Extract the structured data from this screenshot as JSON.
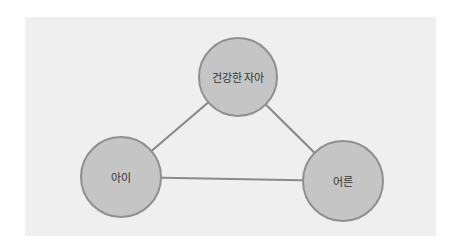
{
  "diagram": {
    "type": "triangle-relationship",
    "colors": {
      "background": "#ffffff",
      "panel": "#efefef",
      "node_fill": "#c5c5c5",
      "node_stroke": "#8f8f8f",
      "edge": "#8a8a8a",
      "text": "#333333"
    },
    "nodes": [
      {
        "id": "healthy-self",
        "label": "건강한 자아",
        "cx": 238,
        "cy": 77,
        "r": 39
      },
      {
        "id": "child",
        "label": "아이",
        "cx": 121,
        "cy": 177,
        "r": 40
      },
      {
        "id": "adult",
        "label": "어른",
        "cx": 343,
        "cy": 181,
        "r": 40
      }
    ],
    "edges": [
      {
        "from": "healthy-self",
        "to": "child"
      },
      {
        "from": "healthy-self",
        "to": "adult"
      },
      {
        "from": "child",
        "to": "adult"
      }
    ]
  }
}
